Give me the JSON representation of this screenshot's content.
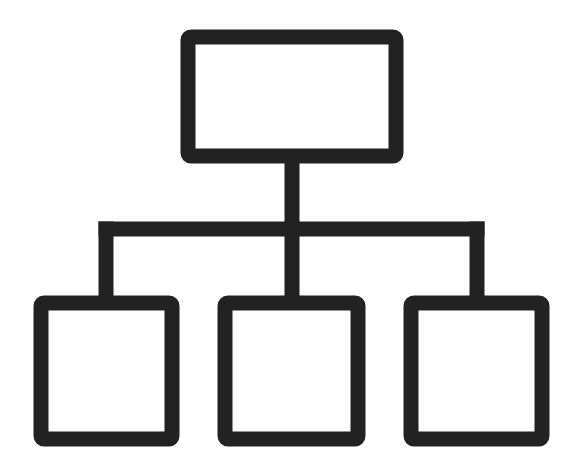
{
  "diagram": {
    "type": "hierarchy-icon",
    "icon": "org-chart-icon",
    "stroke_color": "#222222",
    "background_color": "#ffffff",
    "stroke_width": 15,
    "nodes": [
      {
        "id": "root",
        "level": 0,
        "x": 188,
        "y": 37,
        "w": 208,
        "h": 119
      },
      {
        "id": "child-left",
        "level": 1,
        "x": 41,
        "y": 303,
        "w": 131,
        "h": 136
      },
      {
        "id": "child-middle",
        "level": 1,
        "x": 225,
        "y": 303,
        "w": 133,
        "h": 136
      },
      {
        "id": "child-right",
        "level": 1,
        "x": 411,
        "y": 303,
        "w": 131,
        "h": 136
      }
    ],
    "connectors": {
      "stem": {
        "x": 292,
        "y1": 156,
        "y2": 229
      },
      "bar": {
        "y": 229,
        "x1": 106,
        "x2": 477
      },
      "drops": [
        {
          "x": 106,
          "y1": 229,
          "y2": 303
        },
        {
          "x": 292,
          "y1": 229,
          "y2": 303
        },
        {
          "x": 477,
          "y1": 229,
          "y2": 303
        }
      ]
    }
  }
}
